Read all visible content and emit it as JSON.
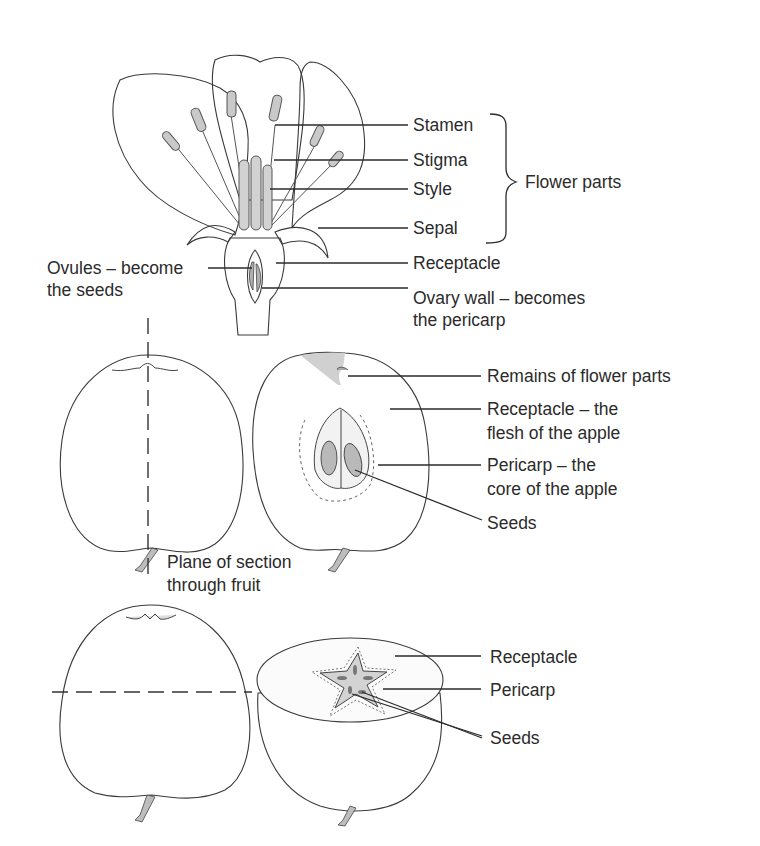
{
  "diagram": {
    "type": "labelled-illustration",
    "flower": {
      "labels": {
        "stamen": "Stamen",
        "stigma": "Stigma",
        "style": "Style",
        "sepal": "Sepal",
        "receptacle": "Receptacle",
        "ovary_wall_1": "Ovary wall – becomes",
        "ovary_wall_2": "the pericarp",
        "ovules_1": "Ovules – become",
        "ovules_2": "the seeds"
      },
      "group_label": "Flower parts"
    },
    "longitudinal_section": {
      "labels": {
        "remains": "Remains of  flower parts",
        "receptacle_1": "Receptacle – the",
        "receptacle_2": "flesh of the apple",
        "pericarp_1": "Pericarp – the",
        "pericarp_2": "core of the apple",
        "seeds": "Seeds"
      },
      "plane_label_1": "Plane of section",
      "plane_label_2": "through fruit"
    },
    "transverse_section": {
      "labels": {
        "receptacle": "Receptacle",
        "pericarp": "Pericarp",
        "seeds": "Seeds"
      }
    },
    "colors": {
      "ink": "#2b2b2b",
      "receptacle_shade": "#b5b5b5",
      "apple_shade": "#e6e6e6",
      "background": "#ffffff"
    }
  }
}
